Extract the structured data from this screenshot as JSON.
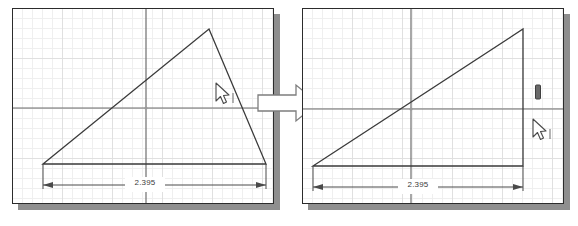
{
  "scene": {
    "background_color": "#ffffff",
    "shadow_color": "#8f8f8f",
    "panel_border_color": "#2c2c2c",
    "grid_minor_color": "#efefef",
    "grid_major_color": "#e0e0e0",
    "axis_color": "#6e6e6e",
    "geometry_color": "#3a3a3a",
    "dimension_color": "#4a4a4a",
    "arrow_fill": "#ffffff",
    "arrow_stroke": "#6e6e6e"
  },
  "panels": [
    {
      "id": "before",
      "name": "left-sketch-panel",
      "caption": "",
      "dimension": {
        "label": "2.395",
        "name": "horizontal-dimension-2395"
      },
      "shape": {
        "type": "obtuse-triangle",
        "description": "Three-sided sketch profile with apex above and to the right of center",
        "vertices": [
          {
            "x": 30,
            "y": 163
          },
          {
            "x": 196,
            "y": 28
          },
          {
            "x": 253,
            "y": 163
          }
        ]
      },
      "axes": {
        "origin_x": 133,
        "origin_y": 107
      },
      "cursor": {
        "x": 216,
        "y": 85,
        "name": "mouse-pointer"
      }
    },
    {
      "id": "after",
      "name": "right-sketch-panel",
      "caption": "",
      "dimension": {
        "label": "2.395",
        "name": "horizontal-dimension-2395"
      },
      "shape": {
        "type": "right-triangle",
        "description": "Profile after constraint: right edge made vertical",
        "vertices": [
          {
            "x": 12,
            "y": 165
          },
          {
            "x": 243,
            "y": 28
          },
          {
            "x": 243,
            "y": 165
          }
        ]
      },
      "axes": {
        "origin_x": 120,
        "origin_y": 109
      },
      "cursor": {
        "x": 243,
        "y": 120,
        "name": "mouse-pointer"
      },
      "constraint_marker": {
        "x": 245,
        "y": 90,
        "name": "vertical-constraint-icon"
      }
    }
  ],
  "transition": {
    "name": "transition-arrow",
    "direction": "right",
    "label": ""
  }
}
